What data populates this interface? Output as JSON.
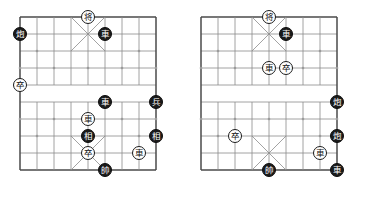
{
  "diagram": {
    "type": "xiangqi-position-pair",
    "title": "",
    "board_geometry": {
      "files": 9,
      "ranks": 10,
      "cell": 17,
      "piece_diameter": 14,
      "river_between_ranks": [
        4,
        5
      ],
      "palace_files": [
        3,
        5
      ],
      "palace_ranks_top": [
        0,
        2
      ],
      "palace_ranks_bottom": [
        7,
        9
      ]
    },
    "colors": {
      "board_line": "#8c8c8c",
      "board_border": "#4a4a4a",
      "black_piece_fill": "#1b1b1b",
      "black_piece_text": "#ffffff",
      "white_piece_fill": "#ffffff",
      "white_piece_text": "#111111",
      "background": "#ffffff",
      "star_point": "#9a9a9a"
    },
    "boards": [
      {
        "name": "left-board",
        "label": "",
        "origin": {
          "x": 20,
          "y": 17
        },
        "pieces": [
          {
            "id": "L1",
            "glyph": "将",
            "side": "white",
            "file": 4,
            "rank": 0,
            "name": "general-white"
          },
          {
            "id": "L2",
            "glyph": "炮",
            "side": "black",
            "file": 0,
            "rank": 1,
            "name": "cannon-black"
          },
          {
            "id": "L3",
            "glyph": "車",
            "side": "black",
            "file": 5,
            "rank": 1,
            "name": "chariot-black"
          },
          {
            "id": "L4",
            "glyph": "卒",
            "side": "white",
            "file": 0,
            "rank": 4,
            "name": "pawn-white"
          },
          {
            "id": "L5",
            "glyph": "車",
            "side": "black",
            "file": 5,
            "rank": 5,
            "name": "chariot-black"
          },
          {
            "id": "L6",
            "glyph": "兵",
            "side": "black",
            "file": 8,
            "rank": 5,
            "name": "soldier-black"
          },
          {
            "id": "L7",
            "glyph": "車",
            "side": "white",
            "file": 4,
            "rank": 6,
            "name": "chariot-white"
          },
          {
            "id": "L8",
            "glyph": "相",
            "side": "black",
            "file": 4,
            "rank": 7,
            "name": "elephant-black"
          },
          {
            "id": "L9",
            "glyph": "相",
            "side": "black",
            "file": 8,
            "rank": 7,
            "name": "elephant-black"
          },
          {
            "id": "L10",
            "glyph": "卒",
            "side": "white",
            "file": 4,
            "rank": 8,
            "name": "pawn-white"
          },
          {
            "id": "L11",
            "glyph": "車",
            "side": "white",
            "file": 7,
            "rank": 8,
            "name": "chariot-white"
          },
          {
            "id": "L12",
            "glyph": "帥",
            "side": "black",
            "file": 5,
            "rank": 9,
            "name": "marshal-black"
          }
        ]
      },
      {
        "name": "right-board",
        "label": "",
        "origin": {
          "x": 201,
          "y": 17
        },
        "pieces": [
          {
            "id": "R1",
            "glyph": "将",
            "side": "white",
            "file": 4,
            "rank": 0,
            "name": "general-white"
          },
          {
            "id": "R2",
            "glyph": "車",
            "side": "black",
            "file": 5,
            "rank": 1,
            "name": "chariot-black"
          },
          {
            "id": "R3",
            "glyph": "車",
            "side": "white",
            "file": 4,
            "rank": 3,
            "name": "chariot-white"
          },
          {
            "id": "R4",
            "glyph": "卒",
            "side": "white",
            "file": 5,
            "rank": 3,
            "name": "pawn-white"
          },
          {
            "id": "R5",
            "glyph": "炮",
            "side": "black",
            "file": 8,
            "rank": 5,
            "name": "cannon-black"
          },
          {
            "id": "R6",
            "glyph": "炮",
            "side": "black",
            "file": 8,
            "rank": 7,
            "name": "cannon-black"
          },
          {
            "id": "R7",
            "glyph": "卒",
            "side": "white",
            "file": 2,
            "rank": 7,
            "name": "pawn-white"
          },
          {
            "id": "R8",
            "glyph": "車",
            "side": "white",
            "file": 7,
            "rank": 8,
            "name": "chariot-white"
          },
          {
            "id": "R9",
            "glyph": "帥",
            "side": "black",
            "file": 4,
            "rank": 9,
            "name": "marshal-black"
          },
          {
            "id": "R10",
            "glyph": "車",
            "side": "black",
            "file": 8,
            "rank": 9,
            "name": "chariot-black"
          }
        ]
      }
    ]
  }
}
